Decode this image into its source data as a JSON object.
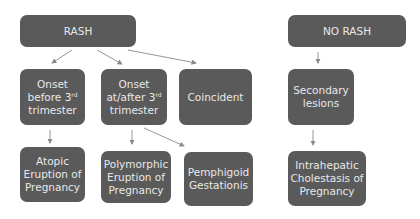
{
  "diagram": {
    "type": "flowchart",
    "colors": {
      "node_fill": "#5a5a5a",
      "node_text": "#e8e8e8",
      "arrow": "#8a8a8a",
      "background": "#ffffff"
    },
    "nodes": {
      "rash": {
        "label": "RASH"
      },
      "no_rash": {
        "label": "NO RASH"
      },
      "onset_before": {
        "line1": "Onset",
        "line2a": "before 3",
        "sup": "rd",
        "line3": "trimester"
      },
      "onset_after": {
        "line1": "Onset",
        "line2a": "at/after 3",
        "sup": "rd",
        "line3": "trimester"
      },
      "coincident": {
        "label": "Coincident"
      },
      "secondary": {
        "line1": "Secondary",
        "line2": "lesions"
      },
      "atopic": {
        "line1": "Atopic",
        "line2": "Eruption of",
        "line3": "Pregnancy"
      },
      "polymorphic": {
        "line1": "Polymorphic",
        "line2": "Eruption of",
        "line3": "Pregnancy"
      },
      "pemphigoid": {
        "line1": "Pemphigoid",
        "line2": "Gestationis"
      },
      "intrahepatic": {
        "line1": "Intrahepatic",
        "line2": "Cholestasis of",
        "line3": "Pregnancy"
      }
    },
    "edges": [
      [
        "RASH",
        "Onset before 3rd trimester"
      ],
      [
        "RASH",
        "Onset at/after 3rd trimester"
      ],
      [
        "RASH",
        "Coincident"
      ],
      [
        "Onset before 3rd trimester",
        "Atopic Eruption of Pregnancy"
      ],
      [
        "Onset at/after 3rd trimester",
        "Polymorphic Eruption of Pregnancy"
      ],
      [
        "Onset at/after 3rd trimester",
        "Pemphigoid Gestationis"
      ],
      [
        "NO RASH",
        "Secondary lesions"
      ],
      [
        "Secondary lesions",
        "Intrahepatic Cholestasis of Pregnancy"
      ]
    ]
  }
}
